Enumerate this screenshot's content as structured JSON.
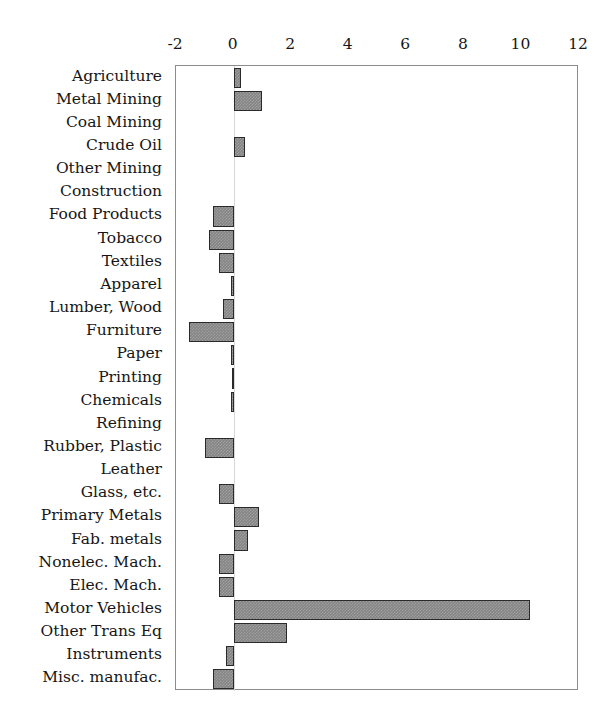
{
  "chart_data": {
    "type": "bar",
    "orientation": "horizontal",
    "title": "",
    "subtitle": "",
    "xlabel": "",
    "ylabel": "",
    "xlim": [
      -2,
      12
    ],
    "ylim": null,
    "grid": false,
    "legend": null,
    "legend_position": "none",
    "xticks": [
      -2,
      0,
      2,
      4,
      6,
      8,
      10,
      12
    ],
    "xtick_labels": [
      "-2",
      "0",
      "2",
      "4",
      "6",
      "8",
      "10",
      "12"
    ],
    "axis_position": "top",
    "bar_color": "#848484",
    "bar_edge_color": "#2a2a2a",
    "categories": [
      "Agriculture",
      "Metal Mining",
      "Coal Mining",
      "Crude Oil",
      "Other Mining",
      "Construction",
      "Food Products",
      "Tobacco",
      "Textiles",
      "Apparel",
      "Lumber, Wood",
      "Furniture",
      "Paper",
      "Printing",
      "Chemicals",
      "Refining",
      "Rubber, Plastic",
      "Leather",
      "Glass, etc.",
      "Primary Metals",
      "Fab. metals",
      "Nonelec. Mach.",
      "Elec. Mach.",
      "Motor Vehicles",
      "Other Trans Eq",
      "Instruments",
      "Misc. manufac."
    ],
    "values": [
      0.25,
      1.0,
      0.0,
      0.4,
      0.0,
      0.0,
      -0.72,
      -0.85,
      -0.5,
      -0.1,
      -0.35,
      -1.55,
      -0.1,
      -0.05,
      -0.08,
      0.0,
      -1.0,
      0.0,
      -0.5,
      0.9,
      0.5,
      -0.5,
      -0.5,
      10.3,
      1.85,
      -0.25,
      -0.7
    ]
  }
}
